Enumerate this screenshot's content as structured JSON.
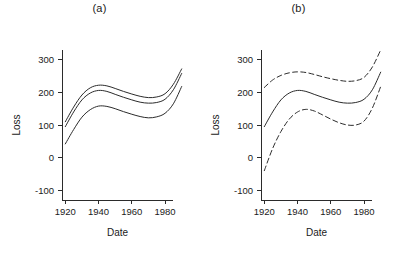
{
  "figure": {
    "background": "#ffffff",
    "line_color": "#2b2b2b",
    "text_color": "#1a1a1a"
  },
  "panels": [
    {
      "id": "a",
      "title": "(a)",
      "xlabel": "Date",
      "ylabel": "Loss"
    },
    {
      "id": "b",
      "title": "(b)",
      "xlabel": "Date",
      "ylabel": "Loss"
    }
  ],
  "axes": {
    "y_ticks": [
      "300",
      "200",
      "100",
      "0",
      "-100"
    ],
    "x_ticks": [
      "1920",
      "1940",
      "1960",
      "1980"
    ]
  },
  "chart_data": [
    {
      "type": "line",
      "title": "(a)",
      "xlabel": "Date",
      "ylabel": "Loss",
      "xlim": [
        1918,
        1992
      ],
      "ylim": [
        -130,
        330
      ],
      "xticks": [
        1920,
        1940,
        1960,
        1980
      ],
      "yticks": [
        -100,
        0,
        100,
        200,
        300
      ],
      "grid": false,
      "legend": "none",
      "x": [
        1920,
        1925,
        1930,
        1935,
        1940,
        1945,
        1950,
        1955,
        1960,
        1965,
        1970,
        1975,
        1980,
        1985,
        1990
      ],
      "series": [
        {
          "name": "upper band",
          "style": "solid",
          "values": [
            110,
            155,
            192,
            214,
            222,
            220,
            212,
            203,
            195,
            188,
            184,
            186,
            196,
            225,
            272
          ]
        },
        {
          "name": "fitted curve",
          "style": "solid",
          "values": [
            95,
            140,
            177,
            198,
            206,
            203,
            194,
            185,
            177,
            170,
            167,
            169,
            179,
            208,
            258
          ]
        },
        {
          "name": "lower band",
          "style": "solid",
          "values": [
            42,
            86,
            124,
            147,
            158,
            157,
            150,
            141,
            133,
            126,
            122,
            125,
            136,
            165,
            218
          ]
        }
      ]
    },
    {
      "type": "line",
      "title": "(b)",
      "xlabel": "Date",
      "ylabel": "Loss",
      "xlim": [
        1918,
        1992
      ],
      "ylim": [
        -130,
        330
      ],
      "xticks": [
        1920,
        1940,
        1960,
        1980
      ],
      "yticks": [
        -100,
        0,
        100,
        200,
        300
      ],
      "grid": false,
      "legend": "none",
      "x": [
        1920,
        1925,
        1930,
        1935,
        1940,
        1945,
        1950,
        1955,
        1960,
        1965,
        1970,
        1975,
        1980,
        1985,
        1990
      ],
      "series": [
        {
          "name": "upper confidence band",
          "style": "dashed",
          "values": [
            215,
            238,
            252,
            260,
            263,
            261,
            255,
            248,
            242,
            237,
            234,
            236,
            246,
            278,
            330
          ]
        },
        {
          "name": "fitted curve",
          "style": "solid",
          "values": [
            95,
            140,
            177,
            198,
            206,
            203,
            194,
            185,
            177,
            170,
            167,
            169,
            179,
            208,
            262
          ]
        },
        {
          "name": "lower confidence band",
          "style": "dashed",
          "values": [
            -40,
            28,
            80,
            118,
            140,
            148,
            143,
            131,
            118,
            107,
            100,
            100,
            112,
            152,
            218
          ]
        }
      ]
    }
  ]
}
